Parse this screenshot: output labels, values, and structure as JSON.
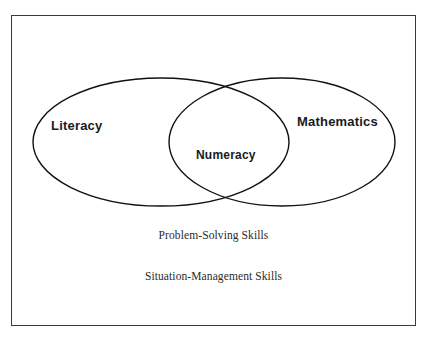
{
  "diagram": {
    "type": "venn",
    "title": "",
    "background_color": "#ffffff",
    "stroke_color": "#111111",
    "frame": {
      "name": "outer-border",
      "color": "#3a3a3a"
    },
    "sets": [
      {
        "id": "literacy",
        "label": "Literacy",
        "shape": "ellipse",
        "cx": 161,
        "cy": 142,
        "rx": 128,
        "ry": 64
      },
      {
        "id": "mathematics",
        "label": "Mathematics",
        "shape": "ellipse",
        "cx": 282,
        "cy": 142,
        "rx": 113,
        "ry": 64
      }
    ],
    "intersection": {
      "id": "numeracy",
      "label": "Numeracy",
      "sets": [
        "literacy",
        "mathematics"
      ]
    },
    "captions": [
      "Problem-Solving Skills",
      "Situation-Management Skills"
    ]
  }
}
